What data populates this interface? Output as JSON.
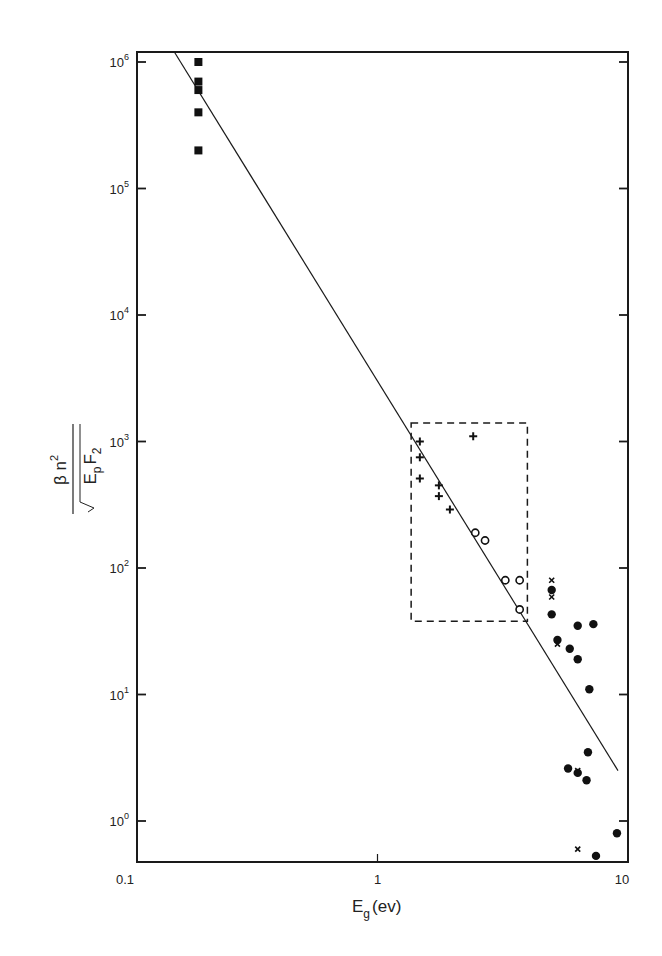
{
  "chart_data": {
    "type": "scatter",
    "title": "",
    "xlabel": "E_g (ev)",
    "ylabel": "β n² / (√E_p F₂)",
    "xscale": "log",
    "yscale": "log",
    "xlim": [
      0.1,
      10
    ],
    "ylim": [
      0.45,
      1300000
    ],
    "x_ticks": [
      {
        "value": 0.1,
        "label": "0.1"
      },
      {
        "value": 1,
        "label": "1"
      },
      {
        "value": 10,
        "label": "10"
      }
    ],
    "y_ticks": [
      {
        "value": 1,
        "base": "10",
        "exp": "0"
      },
      {
        "value": 10,
        "base": "10",
        "exp": "1"
      },
      {
        "value": 100,
        "base": "10",
        "exp": "2"
      },
      {
        "value": 1000,
        "base": "10",
        "exp": "3"
      },
      {
        "value": 10000,
        "base": "10",
        "exp": "4"
      },
      {
        "value": 100000,
        "base": "10",
        "exp": "5"
      },
      {
        "value": 1000000,
        "base": "10",
        "exp": "6"
      }
    ],
    "grid": false,
    "legend": null,
    "fit_line": {
      "x": [
        0.143,
        10
      ],
      "y": [
        1200000,
        2.5
      ]
    },
    "annotation_box": {
      "style": "dashed",
      "x": [
        1.38,
        4.2
      ],
      "y": [
        38,
        1400
      ]
    },
    "series": [
      {
        "name": "filled squares",
        "marker": "square-filled",
        "points": [
          [
            0.18,
            1000000
          ],
          [
            0.18,
            700000
          ],
          [
            0.18,
            600000
          ],
          [
            0.18,
            400000
          ],
          [
            0.18,
            200000
          ]
        ]
      },
      {
        "name": "plus",
        "marker": "plus",
        "points": [
          [
            1.5,
            1000
          ],
          [
            1.5,
            750
          ],
          [
            1.5,
            510
          ],
          [
            1.8,
            450
          ],
          [
            1.8,
            370
          ],
          [
            2.0,
            290
          ],
          [
            2.5,
            1100
          ]
        ]
      },
      {
        "name": "open circles",
        "marker": "circle-open",
        "points": [
          [
            2.55,
            190
          ],
          [
            2.8,
            165
          ],
          [
            3.4,
            80
          ],
          [
            3.9,
            80
          ],
          [
            3.9,
            47
          ]
        ]
      },
      {
        "name": "filled circles",
        "marker": "circle-filled",
        "points": [
          [
            5.3,
            67
          ],
          [
            5.3,
            43
          ],
          [
            5.6,
            27
          ],
          [
            6.8,
            35
          ],
          [
            6.3,
            23
          ],
          [
            6.8,
            19
          ],
          [
            7.9,
            36
          ],
          [
            7.6,
            11
          ],
          [
            7.4,
            2.1
          ],
          [
            6.2,
            2.6
          ],
          [
            6.8,
            2.4
          ],
          [
            7.5,
            3.5
          ],
          [
            9.9,
            0.8
          ],
          [
            8.1,
            0.53
          ]
        ]
      },
      {
        "name": "crosses",
        "marker": "x",
        "points": [
          [
            5.3,
            80
          ],
          [
            5.3,
            59
          ],
          [
            5.6,
            25
          ],
          [
            6.8,
            2.5
          ],
          [
            6.8,
            0.6
          ]
        ]
      }
    ]
  },
  "labels": {
    "x_axis_main": "E",
    "x_axis_sub": "g",
    "x_axis_unit": "(ev)",
    "y_numerator": "β n",
    "y_numerator_sup": "2",
    "y_denominator_main": "E",
    "y_denominator_sub": "p",
    "y_denominator_f": "F",
    "y_denominator_f_sub": "2"
  }
}
